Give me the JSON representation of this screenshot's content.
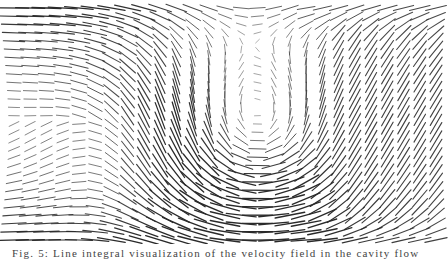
{
  "figure": {
    "type": "vector-field-hedgehog",
    "stroke_color": "#2a2a2a",
    "background": "#ffffff",
    "domain": {
      "x0": 14,
      "x1": 436,
      "y0": 8,
      "y1": 240
    },
    "grid": {
      "cols": 27,
      "rows": 29
    },
    "segment_max_length": 30,
    "freestream": {
      "u": 1.0,
      "v": 0.0
    },
    "vortices": [
      {
        "name": "central-recirculation",
        "x": 250,
        "y": 130,
        "strength": -1.25,
        "radius": 85
      },
      {
        "name": "left-recirculation",
        "x": 130,
        "y": 150,
        "strength": 0.55,
        "radius": 60
      }
    ],
    "shear_region": {
      "x_start": 300,
      "x_end": 436,
      "angle_deg": -60
    }
  },
  "caption": {
    "text": "Fig. 5: Line integral visualization of the velocity field in the cavity flow",
    "truncated": true
  }
}
